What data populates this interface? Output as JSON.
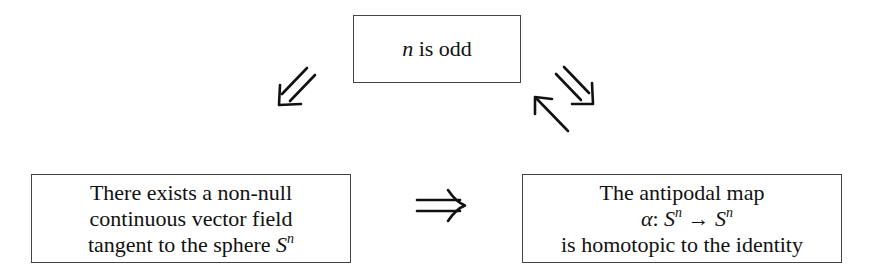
{
  "diagram": {
    "top_box": {
      "var": "n",
      "text": " is odd"
    },
    "left_box": {
      "lines": [
        "There exists a non-null",
        "continuous vector field",
        "tangent to the sphere "
      ],
      "sphere_symbol": "S",
      "sphere_exp": "n"
    },
    "right_box": {
      "line1": "The antipodal map",
      "map_name": "α",
      "map_colon": ": ",
      "domain": "S",
      "domain_exp": "n",
      "arrow": " → ",
      "codomain": "S",
      "codomain_exp": "n",
      "line3": "is homotopic to the identity"
    },
    "arrows": [
      {
        "from": "top_box",
        "to": "left_box",
        "type": "double-implication"
      },
      {
        "from": "left_box",
        "to": "right_box",
        "type": "double-implication"
      },
      {
        "from": "top_box",
        "to": "right_box",
        "type": "double-implication"
      },
      {
        "from": "right_box",
        "to": "top_box",
        "type": "single-arrow"
      }
    ]
  }
}
